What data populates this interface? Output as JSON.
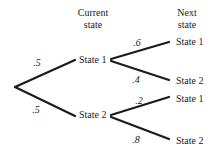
{
  "diagram": {
    "type": "probability-tree",
    "headers": {
      "current": [
        "Current",
        "state"
      ],
      "next": [
        "Next",
        "state"
      ]
    },
    "current_states": [
      "State 1",
      "State 2"
    ],
    "next_states": [
      "State 1",
      "State 2",
      "State 1",
      "State 2"
    ],
    "probabilities": {
      "root_to_state1": ".5",
      "root_to_state2": ".5",
      "state1_to_state1": ".6",
      "state1_to_state2": ".4",
      "state2_to_state1": ".2",
      "state2_to_state2": ".8"
    },
    "colors": {
      "ink": "#1b1b1b",
      "background": "#ffffff"
    }
  }
}
